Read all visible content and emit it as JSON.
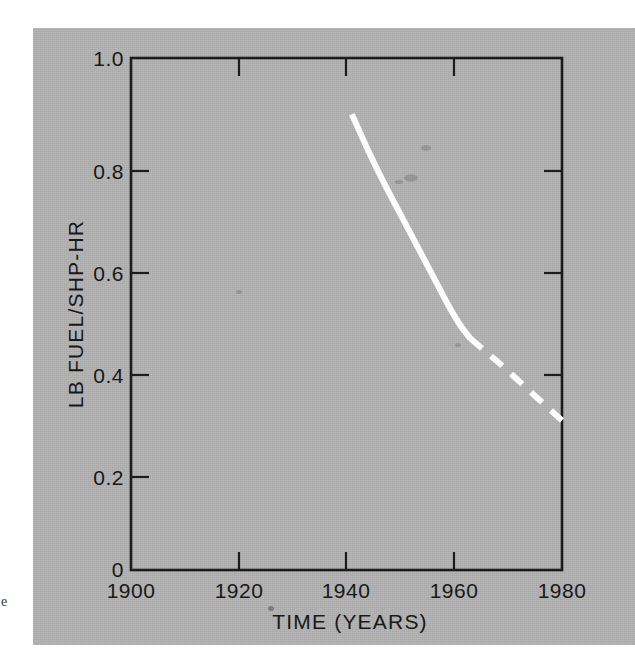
{
  "figure": {
    "background_color": "#b2b2b2",
    "page_color": "#ffffff",
    "margin_speck_glyph": "e"
  },
  "chart_data": {
    "type": "line",
    "title": "",
    "xlabel": "TIME (YEARS)",
    "ylabel": "LB FUEL/SHP-HR",
    "xlim": [
      1900,
      1980
    ],
    "ylim": [
      0,
      1.0
    ],
    "grid": false,
    "legend": null,
    "x_ticks": [
      1900,
      1920,
      1940,
      1960,
      1980
    ],
    "x_tick_labels": [
      "1900",
      "1920",
      "1940",
      "1960",
      "1980"
    ],
    "y_ticks": [
      0,
      0.2,
      0.4,
      0.6,
      0.8,
      1.0
    ],
    "y_tick_labels": [
      "0",
      "0.2",
      "0.4",
      "0.6",
      "0.8",
      "1.0"
    ],
    "series": [
      {
        "name": "specific fuel consumption (historical)",
        "style": "solid",
        "color": "#fdfdfd",
        "x": [
          1941,
          1944,
          1947,
          1950,
          1953,
          1956,
          1959,
          1961,
          1963
        ],
        "y": [
          0.89,
          0.82,
          0.755,
          0.695,
          0.635,
          0.575,
          0.515,
          0.48,
          0.452
        ]
      },
      {
        "name": "specific fuel consumption (projected)",
        "style": "dashed",
        "color": "#fdfdfd",
        "x": [
          1963,
          1966,
          1969,
          1972,
          1975,
          1978,
          1980
        ],
        "y": [
          0.452,
          0.425,
          0.398,
          0.369,
          0.34,
          0.311,
          0.292
        ]
      }
    ]
  }
}
